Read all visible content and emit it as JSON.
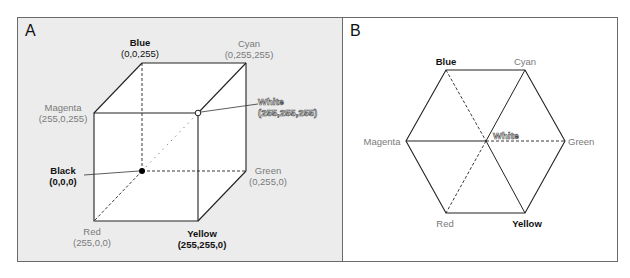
{
  "panels": {
    "a": {
      "letter": "A",
      "title": "RGB color cube",
      "vertices": {
        "blue": {
          "name": "Blue",
          "rgb": "(0,0,255)",
          "style": "bold-dark"
        },
        "cyan": {
          "name": "Cyan",
          "rgb": "(0,255,255)",
          "style": "gray"
        },
        "magenta": {
          "name": "Magenta",
          "rgb": "(255,0,255)",
          "style": "gray"
        },
        "white": {
          "name": "White",
          "rgb": "(255,255,255)",
          "style": "outlined"
        },
        "black": {
          "name": "Black",
          "rgb": "(0,0,0)",
          "style": "bold-dark"
        },
        "green": {
          "name": "Green",
          "rgb": "(0,255,0)",
          "style": "gray"
        },
        "red": {
          "name": "Red",
          "rgb": "(255,0,0)",
          "style": "gray"
        },
        "yellow": {
          "name": "Yellow",
          "rgb": "(255,255,0)",
          "style": "bold-dark"
        }
      }
    },
    "b": {
      "letter": "B",
      "title": "Hexagon projection along gray axis",
      "vertices": {
        "blue": "Blue",
        "cyan": "Cyan",
        "magenta": "Magenta",
        "white": "White",
        "green": "Green",
        "red": "Red",
        "yellow": "Yellow"
      }
    }
  },
  "colors": {
    "panel_bg": "#ececec",
    "panel_border": "#6a6a6a",
    "face_fill": "#ffffff",
    "line": "#222222",
    "dark_label": "#111111",
    "gray_label": "#7a7a7a"
  }
}
